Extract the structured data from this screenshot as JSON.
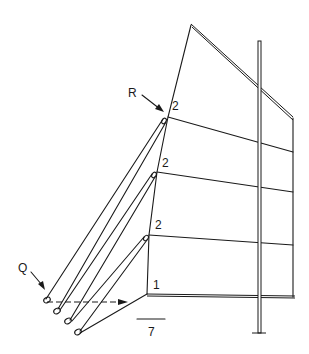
{
  "diagram": {
    "type": "sail rigging line drawing",
    "labels": {
      "R": "R",
      "Q": "Q",
      "batten_upper": "2",
      "batten_middle": "2",
      "batten_lower": "2",
      "tack": "1",
      "scale": "7"
    },
    "colors": {
      "line": "#1a1a1a",
      "background": "#ffffff"
    }
  }
}
